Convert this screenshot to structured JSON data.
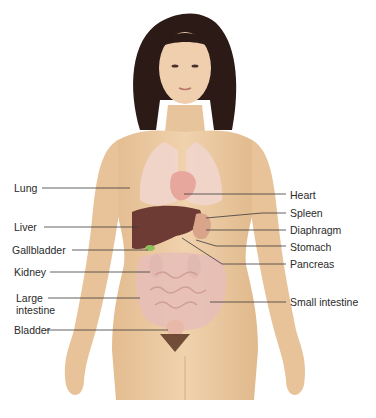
{
  "diagram": {
    "colors": {
      "skin": "#eccaa0",
      "skin_shadow": "#d9b083",
      "hair": "#2b1a16",
      "lung": "#f1d5cc",
      "liver": "#6e3a34",
      "kidney": "#8c5a58",
      "intestine": "#e7bfb6",
      "gallbladder": "#8fbf5a",
      "line": "#3a3a3a"
    },
    "left_labels": [
      {
        "id": "lung",
        "text": "Lung"
      },
      {
        "id": "liver",
        "text": "Liver"
      },
      {
        "id": "gallbladder",
        "text": "Gallbladder"
      },
      {
        "id": "kidney",
        "text": "Kidney"
      },
      {
        "id": "large-intestine",
        "text": "Large intestine"
      },
      {
        "id": "bladder",
        "text": "Bladder"
      }
    ],
    "right_labels": [
      {
        "id": "heart",
        "text": "Heart"
      },
      {
        "id": "spleen",
        "text": "Spleen"
      },
      {
        "id": "diaphragm",
        "text": "Diaphragm"
      },
      {
        "id": "stomach",
        "text": "Stomach"
      },
      {
        "id": "pancreas",
        "text": "Pancreas"
      },
      {
        "id": "small-intestine",
        "text": "Small intestine"
      }
    ]
  }
}
